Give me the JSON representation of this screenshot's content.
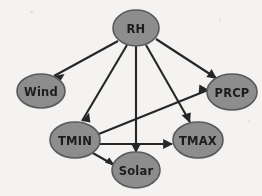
{
  "diagram": {
    "type": "directed-acyclic-graph",
    "background_color": "#f4f3f1",
    "node_fill_color": "#8d8d8d",
    "node_stroke_color": "#5a5a5a",
    "edge_color": "#262626",
    "label_color": "#1c1c1c",
    "nodes": [
      {
        "id": "RH",
        "label": "RH",
        "cx": 136,
        "cy": 28,
        "rx": 23,
        "ry": 18
      },
      {
        "id": "Wind",
        "label": "Wind",
        "cx": 41,
        "cy": 91,
        "rx": 24,
        "ry": 17
      },
      {
        "id": "PRCP",
        "label": "PRCP",
        "cx": 232,
        "cy": 92,
        "rx": 25,
        "ry": 18
      },
      {
        "id": "TMIN",
        "label": "TMIN",
        "cx": 75,
        "cy": 140,
        "rx": 25,
        "ry": 18
      },
      {
        "id": "TMAX",
        "label": "TMAX",
        "cx": 198,
        "cy": 140,
        "rx": 25,
        "ry": 18
      },
      {
        "id": "Solar",
        "label": "Solar",
        "cx": 136,
        "cy": 170,
        "rx": 24,
        "ry": 18
      }
    ],
    "edges": [
      {
        "from": "RH",
        "to": "Wind",
        "label": "RH to Wind"
      },
      {
        "from": "RH",
        "to": "TMIN",
        "label": "RH to TMIN"
      },
      {
        "from": "RH",
        "to": "Solar",
        "label": "RH to Solar"
      },
      {
        "from": "RH",
        "to": "TMAX",
        "label": "RH to TMAX"
      },
      {
        "from": "RH",
        "to": "PRCP",
        "label": "RH to PRCP"
      },
      {
        "from": "TMIN",
        "to": "PRCP",
        "label": "TMIN to PRCP"
      },
      {
        "from": "TMIN",
        "to": "TMAX",
        "label": "TMIN to TMAX"
      },
      {
        "from": "TMIN",
        "to": "Solar",
        "label": "TMIN to Solar"
      }
    ]
  }
}
